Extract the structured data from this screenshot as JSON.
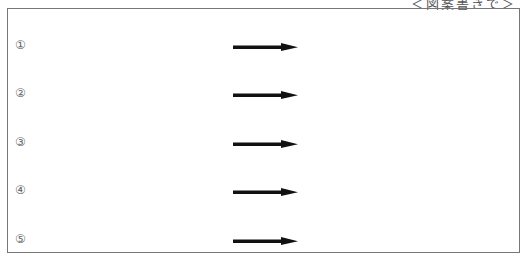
{
  "header": {
    "caption": "＜図案書きで＞"
  },
  "rows": [
    {
      "label": "①",
      "arrow_icon": "right-arrow"
    },
    {
      "label": "②",
      "arrow_icon": "right-arrow"
    },
    {
      "label": "③",
      "arrow_icon": "right-arrow"
    },
    {
      "label": "④",
      "arrow_icon": "right-arrow"
    },
    {
      "label": "⑤",
      "arrow_icon": "right-arrow"
    }
  ],
  "colors": {
    "border": "#777777",
    "arrow": "#111111",
    "label": "#666666"
  }
}
